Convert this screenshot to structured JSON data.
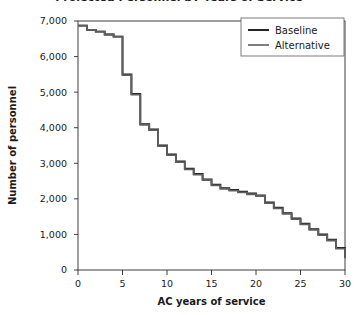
{
  "figure": {
    "title_clipped": "Projected Personnel by Years of Service",
    "background_color": "#ffffff",
    "frame_color": "#2b2b2b"
  },
  "legend": {
    "position": "top-right",
    "entries": [
      {
        "label": "Baseline",
        "color": "#1a1a1a",
        "width": 1.9
      },
      {
        "label": "Alternative",
        "color": "#5e5e5e",
        "width": 1.6
      }
    ]
  },
  "chart_data": {
    "type": "line",
    "step": "post",
    "title": "",
    "xlabel": "AC years of service",
    "ylabel": "Number of personnel",
    "xlim": [
      0,
      30
    ],
    "ylim": [
      0,
      7000
    ],
    "grid": false,
    "legend_position": "top-right",
    "xticks": [
      0,
      5,
      10,
      15,
      20,
      25,
      30
    ],
    "xtick_labels": [
      "0",
      "5",
      "10",
      "15",
      "20",
      "25",
      "30"
    ],
    "yticks": [
      0,
      1000,
      2000,
      3000,
      4000,
      5000,
      6000,
      7000
    ],
    "ytick_labels": [
      "0",
      "1,000",
      "2,000",
      "3,000",
      "4,000",
      "5,000",
      "6,000",
      "7,000"
    ],
    "x": [
      0,
      1,
      2,
      3,
      4,
      5,
      6,
      7,
      8,
      9,
      10,
      11,
      12,
      13,
      14,
      15,
      16,
      17,
      18,
      19,
      20,
      21,
      22,
      23,
      24,
      25,
      26,
      27,
      28,
      29,
      30
    ],
    "series": [
      {
        "name": "Baseline",
        "color": "#1a1a1a",
        "values": [
          6870,
          6750,
          6700,
          6620,
          6560,
          5500,
          4950,
          4100,
          3950,
          3500,
          3250,
          3050,
          2850,
          2700,
          2550,
          2400,
          2300,
          2250,
          2200,
          2150,
          2100,
          1900,
          1750,
          1600,
          1450,
          1300,
          1150,
          1000,
          850,
          620,
          350
        ]
      },
      {
        "name": "Alternative",
        "color": "#5e5e5e",
        "values": [
          6870,
          6750,
          6700,
          6620,
          6560,
          5480,
          4930,
          4080,
          3930,
          3480,
          3230,
          3030,
          2830,
          2680,
          2530,
          2380,
          2280,
          2230,
          2180,
          2130,
          2080,
          1880,
          1730,
          1580,
          1430,
          1280,
          1130,
          980,
          830,
          600,
          330
        ]
      }
    ]
  }
}
